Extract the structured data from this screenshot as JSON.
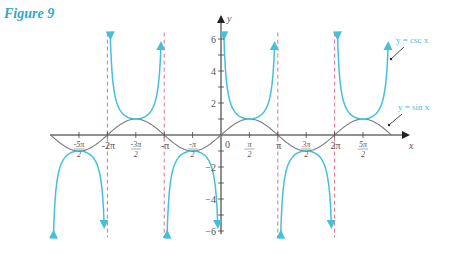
{
  "figure": {
    "title": "Figure 9"
  },
  "chart_data": {
    "type": "line",
    "title": "Figure 9",
    "xlabel": "x",
    "ylabel": "y",
    "xlim": [
      -9.42,
      9.42
    ],
    "ylim": [
      -6,
      6
    ],
    "grid": false,
    "x_tick_labels": [
      "-5π/2",
      "-2π",
      "-3π/2",
      "-π",
      "-π/2",
      "0",
      "π/2",
      "π",
      "3π/2",
      "2π",
      "5π/2"
    ],
    "x_tick_values": [
      -7.854,
      -6.283,
      -4.712,
      -3.142,
      -1.571,
      0,
      1.571,
      3.142,
      4.712,
      6.283,
      7.854
    ],
    "y_tick_labels": [
      "-6",
      "-4",
      "-2",
      "2",
      "4",
      "6"
    ],
    "y_tick_values": [
      -6,
      -4,
      -2,
      2,
      4,
      6
    ],
    "series": [
      {
        "name": "y = csc x",
        "color": "#45c0dc",
        "function": "csc(x)",
        "domain": [
          -9.42,
          9.42
        ]
      },
      {
        "name": "y = sin x",
        "color": "#7a7a7a",
        "function": "sin(x)",
        "domain": [
          -9.42,
          9.42
        ]
      }
    ],
    "asymptotes": {
      "x": [
        -6.283,
        -3.142,
        3.142,
        6.283
      ],
      "color": "#e07090",
      "style": "dashed"
    },
    "annotations": [
      {
        "text": "y = csc x",
        "points_to": "csc branch near x≈3π"
      },
      {
        "text": "y = sin x",
        "points_to": "sin curve near x≈3π"
      }
    ]
  },
  "labels": {
    "x_axis": "x",
    "y_axis": "y",
    "origin": "0",
    "csc": "y = csc x",
    "sin": "y = sin x"
  }
}
